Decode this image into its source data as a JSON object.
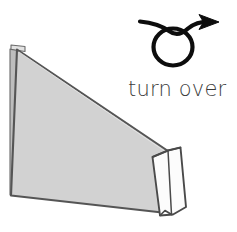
{
  "figure": {
    "type": "origami-instruction-diagram",
    "title": "turn over",
    "instruction_label": "turn over",
    "colors": {
      "paper_fill": "#d2d2d2",
      "paper_edge": "#555555",
      "flap_fill": "#fdfdfd",
      "flap_edge": "#4a4a4a",
      "spine_fill": "#b9b9b9",
      "symbol_stroke": "#0d0d0d",
      "text_color": "#3a3a3a",
      "background": "#ffffff"
    },
    "shapes": {
      "main_paper": {
        "name": "folded-paper-body",
        "points": "17,49 11,195 171,215 168,152"
      },
      "main_paper_outline": {
        "points": "17,49 168,152 171,215 11,195"
      },
      "spine_strip": {
        "name": "paper-spine-edge",
        "points": "11,50 17,49 17,195 11,195"
      },
      "top_flap_tab": {
        "name": "top-corner-tab",
        "points": "12,46 24,47 24,52 17,50"
      },
      "white_flap_outer": {
        "name": "white-flap-panel",
        "points": "152,156 179,147 186,207 160,215"
      },
      "white_flap_crease": {
        "name": "flap-center-crease",
        "x1": 168,
        "y1": 150,
        "x2": 171,
        "y2": 212
      },
      "flap_apex_left": {
        "name": "flap-apex-left-edge",
        "x1": 168,
        "y1": 150,
        "x2": 152,
        "y2": 157
      },
      "flap_apex_right": {
        "name": "flap-apex-right-edge",
        "x1": 168,
        "y1": 150,
        "x2": 180,
        "y2": 148
      }
    },
    "turn_over_symbol": {
      "name": "turn-over-arrow-loop",
      "loop_cx": 173,
      "loop_cy": 46,
      "loop_rx": 19,
      "loop_ry": 18,
      "tail_start_x": 140,
      "tail_start_y": 22,
      "arrow_tip_x": 216,
      "arrow_tip_y": 22
    }
  }
}
